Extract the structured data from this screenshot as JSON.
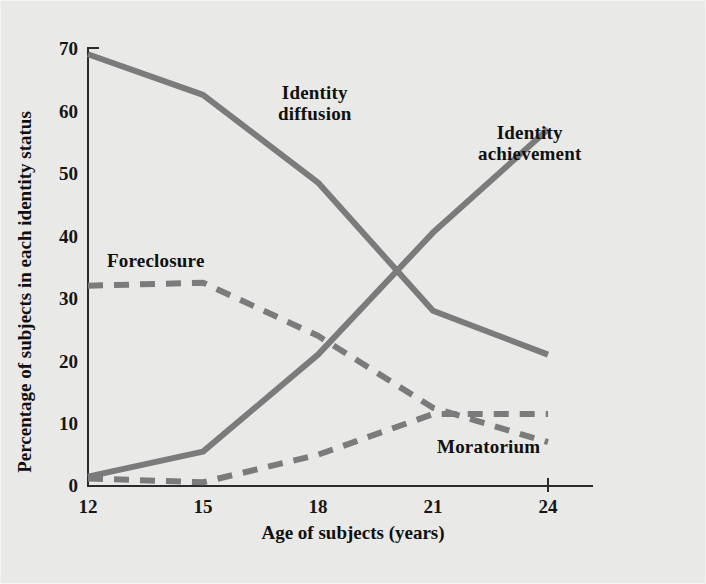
{
  "chart_data": {
    "type": "line",
    "title": "",
    "xlabel": "Age of subjects (years)",
    "ylabel": "Percentage of subjects in each identity status",
    "x": [
      12,
      15,
      18,
      21,
      24
    ],
    "xlim": [
      12,
      24
    ],
    "ylim": [
      0,
      70
    ],
    "xticks": [
      "12",
      "15",
      "18",
      "21",
      "24"
    ],
    "yticks": [
      "0",
      "10",
      "20",
      "30",
      "40",
      "50",
      "60",
      "70"
    ],
    "grid": false,
    "legend_position": "inline-annotations",
    "line_color": "#7b7b7b",
    "axis_color": "#2b2b2b",
    "background_color": "#e9e9e7",
    "series": [
      {
        "name": "Identity diffusion",
        "style": "solid",
        "color": "#7b7b7b",
        "values": [
          69,
          62.5,
          48.5,
          28,
          21
        ]
      },
      {
        "name": "Identity achievement",
        "style": "solid",
        "color": "#7b7b7b",
        "values": [
          1.5,
          5.5,
          21,
          40.5,
          57
        ]
      },
      {
        "name": "Foreclosure",
        "style": "dashed",
        "color": "#7b7b7b",
        "values": [
          32,
          32.5,
          24,
          12.5,
          7
        ]
      },
      {
        "name": "Moratorium",
        "style": "dashed",
        "color": "#7b7b7b",
        "values": [
          1.2,
          0.6,
          5,
          11.5,
          11.5
        ]
      }
    ],
    "annotations": [
      {
        "text": "Identity\ndiffusion",
        "series": "Identity diffusion"
      },
      {
        "text": "Identity\nachievement",
        "series": "Identity achievement"
      },
      {
        "text": "Foreclosure",
        "series": "Foreclosure"
      },
      {
        "text": "Moratorium",
        "series": "Moratorium"
      }
    ]
  },
  "labels": {
    "identity_diffusion": "Identity\ndiffusion",
    "identity_achievement": "Identity\nachievement",
    "foreclosure": "Foreclosure",
    "moratorium": "Moratorium",
    "y_axis_title": "Percentage of subjects in each identity status",
    "x_axis_title": "Age of subjects (years)"
  }
}
